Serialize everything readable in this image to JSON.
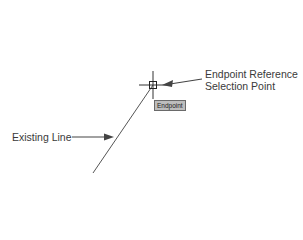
{
  "diagram": {
    "callouts": {
      "endpoint_reference": [
        "Endpoint Reference",
        "Selection Point"
      ],
      "existing_line": "Existing Line"
    },
    "tooltip": "Endpoint",
    "colors": {
      "line": "#555555",
      "text": "#3a3a3a",
      "tooltip_bg": "#bdbdbd"
    }
  }
}
